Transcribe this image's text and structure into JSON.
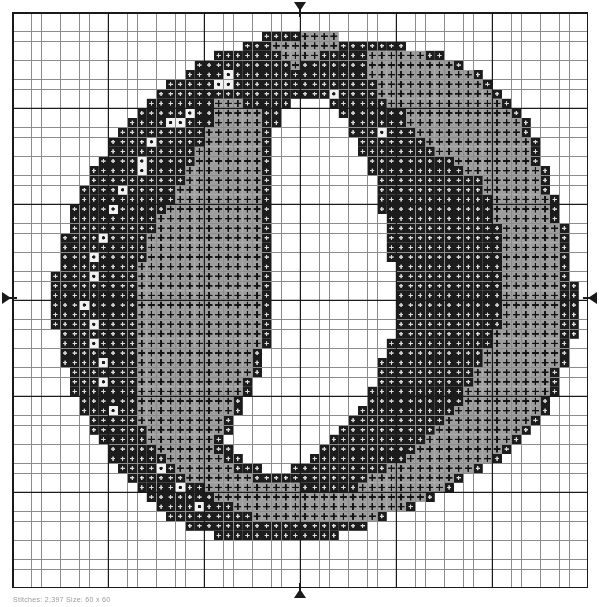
{
  "document": {
    "kind": "cross-stitch-chart",
    "subject": "Digit 0 / letter O monogram",
    "footer_caption": "Stitches: 2,397   Size: 60 x 60"
  },
  "chart": {
    "grid_columns": 60,
    "grid_rows": 60,
    "cell_size_px": 9.6,
    "bold_line_every": 10,
    "grid_line_color": "#8c8c8c",
    "bold_line_color": "#1a1a1a",
    "background_color": "#ffffff",
    "origin_x": 12,
    "origin_y": 12,
    "center_column": 30,
    "center_row": 30
  },
  "markers": {
    "top_label": "center-top-marker",
    "bottom_label": "center-bottom-marker",
    "left_label": "center-left-marker",
    "right_label": "center-right-marker"
  },
  "palette": {
    "blank": {
      "key": ".",
      "name": "Unstitched / fabric",
      "fill": "#ffffff",
      "symbol_color": "#ffffff",
      "symbol": "none"
    },
    "dark": {
      "key": "D",
      "name": "Black thread",
      "fill": "#1c1c1c",
      "symbol_color": "#dcdcdc",
      "symbol": "small-cross"
    },
    "mid": {
      "key": "M",
      "name": "Medium grey thread",
      "fill": "#9e9e9e",
      "symbol_color": "#121212",
      "symbol": "plus"
    },
    "light": {
      "key": "L",
      "name": "Light grey / white thread",
      "fill": "#f2f2f2",
      "symbol_color": "#1a1a1a",
      "symbol": "dot"
    }
  },
  "chart_data": {
    "type": "heatmap",
    "xlabel": "",
    "ylabel": "",
    "legend_position": "none",
    "grid": true,
    "categories": [
      "blank",
      "dark",
      "mid",
      "light"
    ],
    "rows": [
      "............................................................",
      "............................................................",
      "..........................DDDDMMMM..........................",
      "........................DDDMMMMMMMDDDDDDD...................",
      ".....................DDDDDDDMMMMDDDDDMMMMMMDD...............",
      "...................DDDDDDDDDDMDDDDDDDMMMMMMMMMD............",
      "..................DDDDLDDDDDDDDDDDDDDMMMMMMMMMMMD...........",
      "................DDDDDLLDDDDDDDDDDDDDDDMMMMMMMMMMMD..........",
      "...............DDDDDDDDDDDDDDDDDDLDDDDMMMMMMMMMMMMD.........",
      "..............DDDDDDDMMMDDDDD....DDDDDDMMMMMMMMMMMMD........",
      ".............DDDDDLDDMMMMMDD......DDDDDDDMMMMMMMMMMMD.......",
      "............DDDDLLDDDMMMMMDD.......DDDDDDMMMMMMMMMMMMD......",
      "...........DDDDDDDDDMMMMMMD........DDDLDDDMMMMMMMMMMMD......",
      "..........DDDDLDDDDDMMMMMMD.........DDDDDDDMMMMMMMMMMMD.....",
      "..........DDDDDDDDDMMMMMMMD.........DDDDDDDDMMMMMMMMMMD.....",
      ".........DDDDLDDDDDMMMMMMMD..........DDDDDDDDDMMMMMMMMD.....",
      "........DDDDDLDDDDMMMMMMMMD..........DDDDDDDDDDMMMMMMMMD....",
      "........DDDDDDDDDDMMMMMMMMD...........DDDDDDDDDDDMMMMMMD....",
      ".......DDDDLDDDDDMMMMMMMMMD...........DDDDDDDDDDDMMMMMMD....",
      ".......DDDDDDDDDDMMMMMMMMMD...........DDDDDDDDDDDDMMMMMMD...",
      "......DDDDLDDDDDMMMMMMMMMMD...........DDDDDDDDDDDDMMMMMMD...",
      "......DDDDDDDDDMMMMMMMMMMMD............DDDDDDDDDDDMMMMMMD...",
      "......DDDDDDDDDMMMMMMMMMMMD............DDDDDDDDDDDDMMMMMMD..",
      ".....DDDDLDDDDMMMMMMMMMMMMD............DDDDDDDDDDDDMMMMMMD..",
      ".....DDDDDDDDDMMMMMMMMMMMMD............DDDDDDDDDDDDMMMMMMD..",
      ".....DDDLDDDDDMMMMMMMMMMMMD............DDDDDDDDDDDDMMMMMMD..",
      ".....DDDDDDDDMMMMMMMMMMMMMD.............DDDDDDDDDDDMMMMMMD..",
      "....DDDDLDDDDMMMMMMMMMMMMMD.............DDDDDDDDDDDMMMMMMD..",
      "....DDDDDDDDDMMMMMMMMMMMMMD.............DDDDDDDDDDDMMMMMMDD.",
      "....DDDDDDDDDMMMMMMMMMMMMMD.............DDDDDDDDDDDMMMMMMDD.",
      "....DDDLDDDDDMMMMMMMMMMMMMD.............DDDDDDDDDDDMMMMMMDD.",
      "....DDDDDDDDDMMMMMMMMMMMMMD.............DDDDDDDDDDDMMMMMMDD.",
      "....DDDDLDDDDMMMMMMMMMMMMMD.............DDDDDDDDDDDMMMMMMDD.",
      ".....DDDDDDDDMMMMMMMMMMMMMD.............DDDDDDDDDDMMMMMMMDD.",
      ".....DDDLDDDDMMMMMMMMMMMMMD............DDDDDDDDDDDMMMMMMMD..",
      ".....DDDDDDDDMMMMMMMMMMMMD.............DDDDDDDDDDMMMMMMMMD..",
      ".....DDDDLDDDMMMMMMMMMMMMD............DDDDDDDDDDDMMMMMMMMD..",
      "......DDDDDDDMMMMMMMMMMMMD............DDDDDDDDDDMMMMMMMMD...",
      "......DDDLDDDMMMMMMMMMMMD.............DDDDDDDDDDMMMMMMMMD...",
      "......DDDDDDDMMMMMMMMMMMD............DDDDDDDDDDMMMMMMMMMD...",
      ".......DDDDDDMMMMMMMMMMD.............DDDDDDDDDDMMMMMMMMD....",
      ".......DDDLDDMMMMMMMMMMD............DDDDDDDDDDMMMMMMMMMD....",
      "........DDDDDMMMMMMMMMD............DDDDDDDDDDMMMMMMMMMD.....",
      "........DDDDDDMMMMMMMMD...........DDDDDDDDDDMMMMMMMMMD......",
      ".........DDDDDMMMMMMMD...........DDDDDDDDDDMMMMMMMMMD.......",
      "..........DDDDDMMMMMMDD.........DDDDDDDDDDMMMMMMMMMD........",
      "..........DDDDDDMMMMMMDD.......DDDDDDDDDDMMMMMMMMMD.........",
      "...........DDDDLDMMMMMMDDD...DDDDDDDDDDMMMMMMMMMD...........",
      "............DDDDDDMMMMMMMDDDDDDDDDDDDMMMMMMMMMD.............",
      ".............DDDDLDDMMMMMMMMMMDDDDDDMMMMMMMMMD..............",
      "..............DDDDDDDMMMMMMMMMMMMMMMMMMMMMMD...............",
      "...............DDDDLDDDMMMMMMMMMMMMMMMMMMD.................",
      "................DDDDDDDDDMMMMMMMMMMMMMD...................",
      "..................DDDDDDDDDDDDDDDDDDD.....................",
      ".....................DDDDDDDDDDDDD........................",
      "............................................................",
      "............................................................",
      "............................................................",
      "............................................................",
      "............................................................"
    ]
  }
}
